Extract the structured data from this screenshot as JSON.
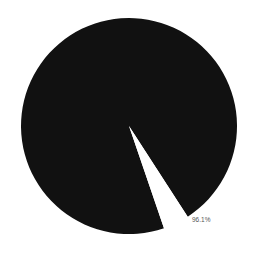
{
  "chart_data": {
    "type": "pie",
    "title": "",
    "labels": [
      "",
      ""
    ],
    "values": [
      96.1,
      3.9
    ],
    "value_labels": [
      "96.1%",
      ""
    ],
    "colors": [
      "#111111",
      "#ffffff"
    ],
    "legend": null,
    "start_angle_deg": 71.1,
    "direction": "clockwise"
  },
  "layout": {
    "center": [
      129,
      126
    ],
    "radius": 108,
    "label_position": [
      192,
      222
    ]
  }
}
